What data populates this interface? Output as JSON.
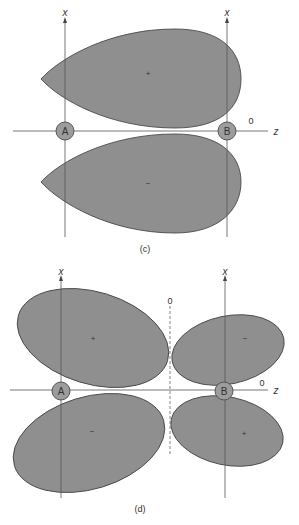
{
  "figure": {
    "background": "#ffffff",
    "lobe_color": "#8f8f8f",
    "panels": [
      {
        "id": "c",
        "caption": "(c)",
        "axes": {
          "vertical_label_a": "x",
          "vertical_label_b": "x",
          "horizontal_label": "z"
        },
        "nuclei": {
          "a": "A",
          "b": "B"
        },
        "node_label": "0",
        "lobes": [
          {
            "position": "upper",
            "sign": "+"
          },
          {
            "position": "lower",
            "sign": "−"
          }
        ]
      },
      {
        "id": "d",
        "caption": "(d)",
        "axes": {
          "vertical_label_a": "x",
          "vertical_label_b": "x",
          "horizontal_label": "z"
        },
        "nuclei": {
          "a": "A",
          "b": "B"
        },
        "node_labels": {
          "vertical_plane": "0",
          "axis": "0"
        },
        "lobes": [
          {
            "position": "upper-left",
            "sign": "+"
          },
          {
            "position": "upper-right",
            "sign": "−"
          },
          {
            "position": "lower-left",
            "sign": "−"
          },
          {
            "position": "lower-right",
            "sign": "+"
          }
        ]
      }
    ]
  }
}
